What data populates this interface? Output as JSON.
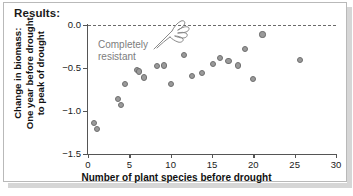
{
  "header": {
    "title": "Results:"
  },
  "annotation": {
    "text": "Completely\nresistant",
    "icon": "pointing-hand-icon",
    "color": "#7d7d7d"
  },
  "style": {
    "point_fill": "#9a9a9a",
    "point_stroke": "#6f6f6f",
    "axis_color": "#555555",
    "zero_line_color": "#6a6a6a"
  },
  "chart_data": {
    "type": "scatter",
    "title": "Results:",
    "xlabel": "Number of plant species before drought",
    "ylabel": "Change in biomass: One year before drought to peak of drought",
    "ylabel_lines": [
      "Change in biomass:",
      "One year before drought",
      "to peak of drought"
    ],
    "xlim": [
      0,
      30
    ],
    "ylim": [
      -1.5,
      0.0
    ],
    "xticks": [
      0,
      5,
      10,
      15,
      20,
      25,
      30
    ],
    "xticklabels": [
      "0",
      "5",
      "10",
      "15",
      "20",
      "25",
      "30"
    ],
    "yticks": [
      0.0,
      -0.5,
      -1.0,
      -1.5
    ],
    "yticklabels": [
      "0.0",
      "-0.5",
      "-1.0",
      "-1.5"
    ],
    "grid": false,
    "legend": false,
    "reference_lines": [
      {
        "axis": "y",
        "value": 0.0,
        "style": "dashed",
        "label": "Completely resistant"
      }
    ],
    "points": [
      {
        "x": 0.7,
        "y": -1.14
      },
      {
        "x": 1.1,
        "y": -1.21
      },
      {
        "x": 3.6,
        "y": -0.86
      },
      {
        "x": 4.0,
        "y": -0.93
      },
      {
        "x": 4.5,
        "y": -0.69
      },
      {
        "x": 5.9,
        "y": -0.52
      },
      {
        "x": 6.2,
        "y": -0.54
      },
      {
        "x": 6.8,
        "y": -0.61
      },
      {
        "x": 8.3,
        "y": -0.48
      },
      {
        "x": 9.2,
        "y": -0.47
      },
      {
        "x": 10.0,
        "y": -0.69
      },
      {
        "x": 11.6,
        "y": -0.35
      },
      {
        "x": 12.6,
        "y": -0.59
      },
      {
        "x": 13.8,
        "y": -0.56
      },
      {
        "x": 15.1,
        "y": -0.45
      },
      {
        "x": 16.0,
        "y": -0.38
      },
      {
        "x": 17.0,
        "y": -0.42
      },
      {
        "x": 18.1,
        "y": -0.47
      },
      {
        "x": 19.0,
        "y": -0.28
      },
      {
        "x": 20.0,
        "y": -0.63
      },
      {
        "x": 21.1,
        "y": -0.11
      },
      {
        "x": 25.6,
        "y": -0.41
      }
    ]
  }
}
